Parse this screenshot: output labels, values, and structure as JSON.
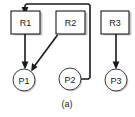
{
  "figure": {
    "caption": "(a)",
    "type": "resource-allocation-graph",
    "colors": {
      "background": "#ffffff",
      "stroke": "#1a1a1a",
      "shadow": "#c9c9c9",
      "node_fill": "#ffffff"
    }
  },
  "resources": [
    {
      "id": "R1",
      "label": "R1",
      "x": 25,
      "y": 22,
      "width": 29,
      "height": 23
    },
    {
      "id": "R2",
      "label": "R2",
      "x": 70,
      "y": 22,
      "width": 29,
      "height": 23
    },
    {
      "id": "R3",
      "label": "R3",
      "x": 115,
      "y": 22,
      "width": 28,
      "height": 23
    }
  ],
  "processes": [
    {
      "id": "P1",
      "label": "P1",
      "cx": 24,
      "cy": 80,
      "r": 11
    },
    {
      "id": "P2",
      "label": "P2",
      "cx": 70,
      "cy": 79,
      "r": 11
    },
    {
      "id": "P3",
      "label": "P3",
      "cx": 116,
      "cy": 80,
      "r": 11
    }
  ],
  "edges": [
    {
      "id": "R1-P1",
      "from": "R1",
      "to": "P1",
      "kind": "assignment",
      "direction": "down"
    },
    {
      "id": "R2-P1",
      "from": "R2",
      "to": "P1",
      "kind": "assignment",
      "direction": "diagonal-down-left"
    },
    {
      "id": "R3-P3",
      "from": "R3",
      "to": "P3",
      "kind": "assignment",
      "direction": "down"
    },
    {
      "id": "P2-R1",
      "from": "P2",
      "to": "R1",
      "kind": "request",
      "direction": "right-up-left-down"
    }
  ]
}
